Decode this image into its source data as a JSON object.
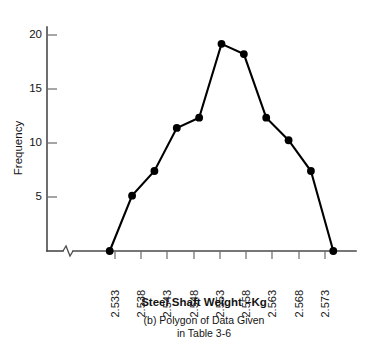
{
  "chart_data": {
    "type": "line",
    "title": "",
    "xlabel": "Steel Shaft Weight –Kg",
    "ylabel": "Frequency",
    "categories": [
      "",
      "2.533",
      "2.538",
      "2.543",
      "2.548",
      "2.553",
      "2.558",
      "2.563",
      "2.568",
      "2.573",
      ""
    ],
    "x": [
      2.528,
      2.533,
      2.538,
      2.543,
      2.548,
      2.553,
      2.558,
      2.563,
      2.568,
      2.573,
      2.578
    ],
    "values": [
      0,
      5.4,
      7.8,
      12.0,
      13.0,
      20.2,
      19.2,
      13.0,
      10.8,
      7.8,
      0
    ],
    "series": [
      {
        "name": "Frequency",
        "values": [
          0,
          5.4,
          7.8,
          12.0,
          13.0,
          20.2,
          19.2,
          13.0,
          10.8,
          7.8,
          0
        ]
      }
    ],
    "xtick_labels": [
      "2.533",
      "2.538",
      "2.543",
      "2.548",
      "2.553",
      "2.558",
      "2.563",
      "2.568",
      "2.573"
    ],
    "ytick_labels": [
      "5",
      "10",
      "15",
      "20"
    ],
    "ytick_values": [
      5,
      10,
      15,
      20
    ],
    "ylim": [
      0,
      22
    ],
    "xlim": [
      2.5265,
      2.5795
    ],
    "grid": false,
    "legend": false,
    "legend_position": "none",
    "marker": "filled-circle",
    "line_color": "#000000",
    "axis_color": "#4a4a4a",
    "axis_break": "x-axis zigzag break near origin",
    "annotations": []
  },
  "caption": {
    "line1": "(b) Polygon of Data Given",
    "line2": "in Table 3-6"
  },
  "axes": {
    "y_title": "Frequency",
    "x_title": "Steel Shaft Weight –Kg"
  }
}
